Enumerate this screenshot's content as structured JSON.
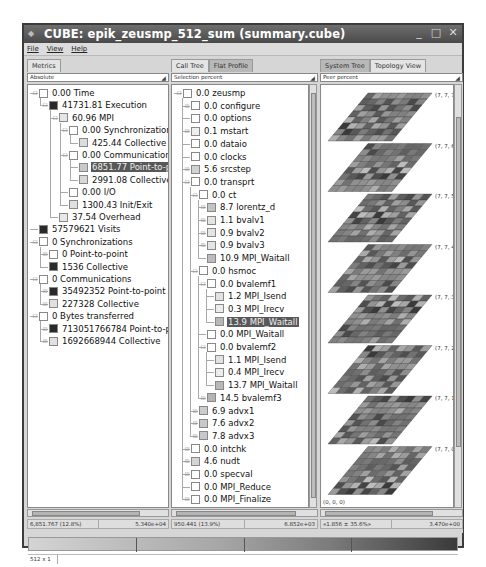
{
  "window": {
    "title": "CUBE: epik_zeusmp_512_sum (summary.cube)",
    "controls": [
      "minimize",
      "maximize",
      "close"
    ]
  },
  "menu": [
    "File",
    "View",
    "Help"
  ],
  "panels": {
    "metrics": {
      "tabs": [
        {
          "label": "Metrics",
          "active": false
        }
      ],
      "combo": "Absolute",
      "rows": [
        {
          "depth": 0,
          "value": "0.00",
          "name": "Time",
          "box": "#ffffff",
          "exp": "-"
        },
        {
          "depth": 1,
          "value": "41731.81",
          "name": "Execution",
          "box": "#2a2a2a",
          "exp": "-"
        },
        {
          "depth": 2,
          "value": "60.96",
          "name": "MPI",
          "box": "#e6e6e6",
          "exp": "-"
        },
        {
          "depth": 3,
          "value": "0.00",
          "name": "Synchronization",
          "box": "#ffffff",
          "exp": "-"
        },
        {
          "depth": 4,
          "value": "425.44",
          "name": "Collective",
          "box": "#dcdcdc",
          "exp": ""
        },
        {
          "depth": 3,
          "value": "0.00",
          "name": "Communication",
          "box": "#ffffff",
          "exp": "-"
        },
        {
          "depth": 4,
          "value": "6851.77",
          "name": "Point-to-po",
          "box": "#c8c8c8",
          "exp": "",
          "selected": true
        },
        {
          "depth": 4,
          "value": "2991.08",
          "name": "Collective",
          "box": "#d8d8d8",
          "exp": ""
        },
        {
          "depth": 3,
          "value": "0.00",
          "name": "I/O",
          "box": "#ffffff",
          "exp": ""
        },
        {
          "depth": 3,
          "value": "1300.43",
          "name": "Init/Exit",
          "box": "#e0e0e0",
          "exp": ""
        },
        {
          "depth": 2,
          "value": "37.54",
          "name": "Overhead",
          "box": "#e8e8e8",
          "exp": ""
        },
        {
          "depth": 0,
          "value": "57579621",
          "name": "Visits",
          "box": "#2a2a2a",
          "exp": ""
        },
        {
          "depth": 0,
          "value": "0",
          "name": "Synchronizations",
          "box": "#ffffff",
          "exp": "-"
        },
        {
          "depth": 1,
          "value": "0",
          "name": "Point-to-point",
          "box": "#ffffff",
          "exp": "+"
        },
        {
          "depth": 1,
          "value": "1536",
          "name": "Collective",
          "box": "#2a2a2a",
          "exp": ""
        },
        {
          "depth": 0,
          "value": "0",
          "name": "Communications",
          "box": "#ffffff",
          "exp": "-"
        },
        {
          "depth": 1,
          "value": "35492352",
          "name": "Point-to-point",
          "box": "#2a2a2a",
          "exp": "+"
        },
        {
          "depth": 1,
          "value": "227328",
          "name": "Collective",
          "box": "#e0e0e0",
          "exp": "+"
        },
        {
          "depth": 0,
          "value": "0",
          "name": "Bytes transferred",
          "box": "#ffffff",
          "exp": "-"
        },
        {
          "depth": 1,
          "value": "713051766784",
          "name": "Point-to-p",
          "box": "#2a2a2a",
          "exp": "+"
        },
        {
          "depth": 1,
          "value": "1692668944",
          "name": "Collective",
          "box": "#e0e0e0",
          "exp": "+"
        }
      ],
      "status_left": "6,851.767  (12.8%)",
      "status_right": "5.340e+04"
    },
    "calltree": {
      "tabs": [
        {
          "label": "Call Tree",
          "active": false
        },
        {
          "label": "Flat Profile",
          "active": true
        }
      ],
      "combo": "Selection percent",
      "rows": [
        {
          "depth": 0,
          "value": "0.0",
          "name": "zeusmp",
          "box": "#ffffff",
          "exp": "-"
        },
        {
          "depth": 1,
          "value": "0.0",
          "name": "configure",
          "box": "#ffffff",
          "exp": "+"
        },
        {
          "depth": 1,
          "value": "0.0",
          "name": "options",
          "box": "#ffffff",
          "exp": ""
        },
        {
          "depth": 1,
          "value": "0.1",
          "name": "mstart",
          "box": "#eeeeee",
          "exp": "+"
        },
        {
          "depth": 1,
          "value": "0.0",
          "name": "dataio",
          "box": "#ffffff",
          "exp": ""
        },
        {
          "depth": 1,
          "value": "0.0",
          "name": "clocks",
          "box": "#ffffff",
          "exp": ""
        },
        {
          "depth": 1,
          "value": "5.6",
          "name": "srcstep",
          "box": "#d2d2d2",
          "exp": "+"
        },
        {
          "depth": 1,
          "value": "0.0",
          "name": "transprt",
          "box": "#ffffff",
          "exp": "-"
        },
        {
          "depth": 2,
          "value": "0.0",
          "name": "ct",
          "box": "#ffffff",
          "exp": "-"
        },
        {
          "depth": 3,
          "value": "8.7",
          "name": "lorentz_d",
          "box": "#c4c4c4",
          "exp": "+"
        },
        {
          "depth": 3,
          "value": "1.1",
          "name": "bvalv1",
          "box": "#e4e4e4",
          "exp": "+"
        },
        {
          "depth": 3,
          "value": "0.9",
          "name": "bvalv2",
          "box": "#e4e4e4",
          "exp": "+"
        },
        {
          "depth": 3,
          "value": "0.9",
          "name": "bvalv3",
          "box": "#e4e4e4",
          "exp": "+"
        },
        {
          "depth": 3,
          "value": "10.9",
          "name": "MPI_Waitall",
          "box": "#bcbcbc",
          "exp": ""
        },
        {
          "depth": 2,
          "value": "0.0",
          "name": "hsmoc",
          "box": "#ffffff",
          "exp": "-"
        },
        {
          "depth": 3,
          "value": "0.0",
          "name": "bvalemf1",
          "box": "#ffffff",
          "exp": "-"
        },
        {
          "depth": 4,
          "value": "1.2",
          "name": "MPI_Isend",
          "box": "#e2e2e2",
          "exp": ""
        },
        {
          "depth": 4,
          "value": "0.3",
          "name": "MPI_Irecv",
          "box": "#ececec",
          "exp": ""
        },
        {
          "depth": 4,
          "value": "13.9",
          "name": "MPI_Waitall",
          "box": "#b8b8b8",
          "exp": "",
          "selected": true
        },
        {
          "depth": 3,
          "value": "0.0",
          "name": "MPI_Waitall",
          "box": "#ffffff",
          "exp": ""
        },
        {
          "depth": 3,
          "value": "0.0",
          "name": "bvalemf2",
          "box": "#ffffff",
          "exp": "-"
        },
        {
          "depth": 4,
          "value": "1.1",
          "name": "MPI_Isend",
          "box": "#e2e2e2",
          "exp": ""
        },
        {
          "depth": 4,
          "value": "0.4",
          "name": "MPI_Irecv",
          "box": "#ececec",
          "exp": ""
        },
        {
          "depth": 4,
          "value": "13.7",
          "name": "MPI_Waitall",
          "box": "#b8b8b8",
          "exp": ""
        },
        {
          "depth": 3,
          "value": "14.5",
          "name": "bvalemf3",
          "box": "#b4b4b4",
          "exp": "+"
        },
        {
          "depth": 2,
          "value": "6.9",
          "name": "advx1",
          "box": "#cccccc",
          "exp": "+"
        },
        {
          "depth": 2,
          "value": "7.6",
          "name": "advx2",
          "box": "#c8c8c8",
          "exp": "+"
        },
        {
          "depth": 2,
          "value": "7.8",
          "name": "advx3",
          "box": "#c8c8c8",
          "exp": "+"
        },
        {
          "depth": 1,
          "value": "0.0",
          "name": "intchk",
          "box": "#ffffff",
          "exp": "+"
        },
        {
          "depth": 1,
          "value": "4.6",
          "name": "nudt",
          "box": "#d4d4d4",
          "exp": "+"
        },
        {
          "depth": 1,
          "value": "0.0",
          "name": "specval",
          "box": "#ffffff",
          "exp": "+"
        },
        {
          "depth": 1,
          "value": "0.0",
          "name": "MPI_Reduce",
          "box": "#ffffff",
          "exp": ""
        },
        {
          "depth": 1,
          "value": "0.0",
          "name": "MPI_Finalize",
          "box": "#ffffff",
          "exp": "+"
        }
      ],
      "status_left": "950.441  (13.9%)",
      "status_right": "6.852e+03"
    },
    "system": {
      "tabs": [
        {
          "label": "System Tree",
          "active": true
        },
        {
          "label": "Topology View",
          "active": false
        }
      ],
      "combo": "Peer percent",
      "planes": [
        "(7, 7, 7)",
        "(7, 7, 6)",
        "(7, 7, 5)",
        "(7, 7, 4)",
        "(7, 7, 3)",
        "(7, 7, 2)",
        "(7, 7, 1)",
        "(7, 7, 0)"
      ],
      "origin": "(0, 0, 0)",
      "status_left": "«1.856 ± 35.6%»",
      "status_right": "3.470e+00"
    }
  },
  "footer": {
    "dims": "512 x 1"
  }
}
